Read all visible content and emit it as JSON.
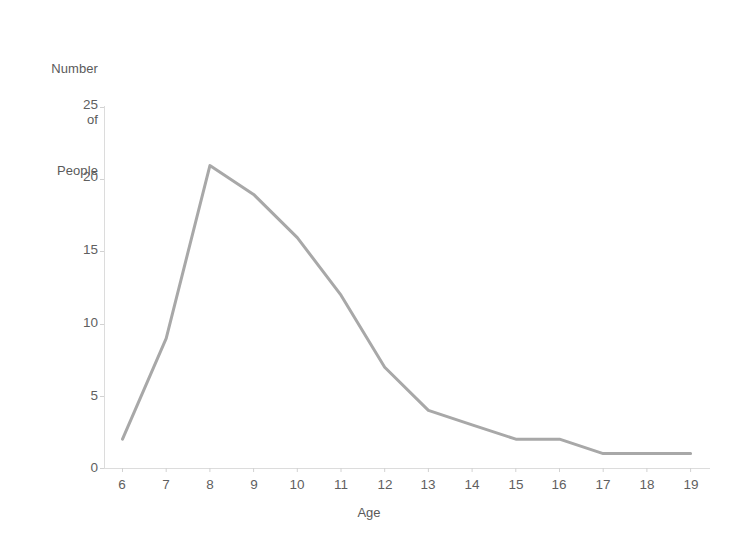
{
  "chart_data": {
    "type": "line",
    "title": "",
    "subtitle": "",
    "xlabel": "Age",
    "ylabel": "Number of People",
    "ylabel_lines": [
      "Number",
      "of",
      "People"
    ],
    "categories": [
      6,
      7,
      8,
      9,
      10,
      11,
      12,
      13,
      14,
      15,
      16,
      17,
      18,
      19
    ],
    "x": [
      6,
      7,
      8,
      9,
      10,
      11,
      12,
      13,
      14,
      15,
      16,
      17,
      18,
      19
    ],
    "values": [
      2,
      9,
      21,
      19,
      16,
      12,
      7,
      4,
      3,
      2,
      2,
      1,
      1,
      1
    ],
    "series": [
      {
        "name": "Number of People",
        "values": [
          2,
          9,
          21,
          19,
          16,
          12,
          7,
          4,
          3,
          2,
          2,
          1,
          1,
          1
        ],
        "color": "#a8a8a8"
      }
    ],
    "xlim": [
      6,
      19
    ],
    "ylim": [
      0,
      25
    ],
    "x_ticks": [
      6,
      7,
      8,
      9,
      10,
      11,
      12,
      13,
      14,
      15,
      16,
      17,
      18,
      19
    ],
    "y_ticks": [
      0,
      5,
      10,
      15,
      20,
      25
    ],
    "x_tick_labels": [
      "6",
      "7",
      "8",
      "9",
      "10",
      "11",
      "12",
      "13",
      "14",
      "15",
      "16",
      "17",
      "18",
      "19"
    ],
    "y_tick_labels": [
      "0",
      "5",
      "10",
      "15",
      "20",
      "25"
    ],
    "grid": false,
    "legend": false,
    "legend_position": "none",
    "annotations": [],
    "line_color": "#a8a8a8",
    "line_width": 3,
    "axis_color": "#d6d6d6",
    "tick_label_color": "#5f5f5f",
    "background": "#ffffff"
  },
  "axes": {
    "y_title_line1": "Number",
    "y_title_line2": "of",
    "y_title_line3": "People",
    "x_title": "Age"
  }
}
